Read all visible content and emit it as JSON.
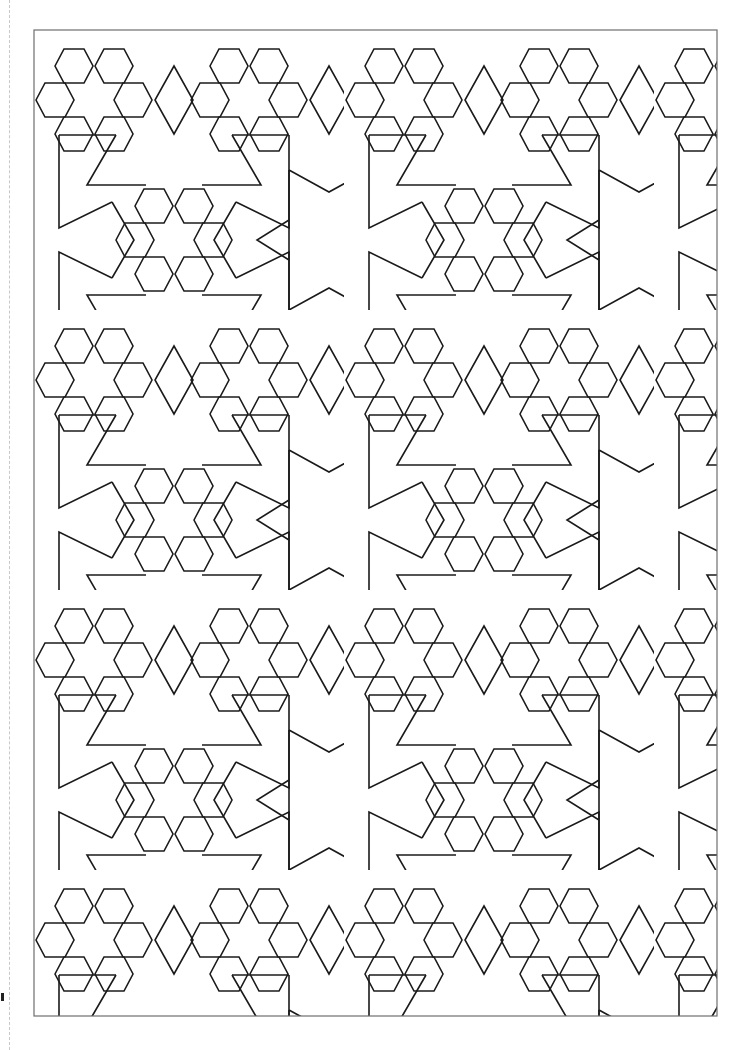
{
  "page": {
    "kind": "coloring-page",
    "background_color": "#ffffff",
    "line_color": "#1a1a1a",
    "frame_color": "#6e6e6e"
  },
  "frame": {
    "x": 34,
    "y": 30,
    "width": 683,
    "height": 986
  },
  "pattern": {
    "motifs": [
      "six-pointed-star",
      "hexagon",
      "rhombus",
      "pentagonal-arm"
    ],
    "tile_width": 310,
    "tile_height": 280
  },
  "guide": {
    "x": 9,
    "style": "dashed"
  },
  "corner_mark": {
    "x": 1,
    "y": 993
  }
}
